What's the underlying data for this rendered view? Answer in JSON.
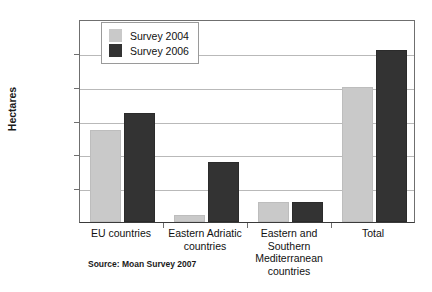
{
  "chart_data": {
    "type": "bar",
    "title": "",
    "xlabel": "",
    "ylabel": "Hectares",
    "ylim": [
      0,
      6000000
    ],
    "ytick_values": [
      0,
      1000000,
      2000000,
      3000000,
      4000000,
      5000000,
      6000000
    ],
    "ytick_labels": [
      "0",
      "1'000'000",
      "2'000'000",
      "3'000'000",
      "4'000'000",
      "5'000'000",
      "6'000'000"
    ],
    "grid": true,
    "legend_position": "upper left",
    "categories": [
      "EU countries",
      "Eastern Adriatic countries",
      "Eastern and Southern Mediterranean countries",
      "Total"
    ],
    "category_label_lines": [
      [
        "EU countries"
      ],
      [
        "Eastern Adriatic",
        "countries"
      ],
      [
        "Eastern and",
        "Southern",
        "Mediterranean",
        "countries"
      ],
      [
        "Total"
      ]
    ],
    "series": [
      {
        "name": "Survey 2004",
        "color": "#c9c9c9",
        "values": [
          2720000,
          210000,
          600000,
          4000000
        ]
      },
      {
        "name": "Survey 2006",
        "color": "#333333",
        "values": [
          3220000,
          1760000,
          600000,
          5070000
        ]
      }
    ],
    "source": "Source: Moan Survey 2007"
  },
  "legend": {
    "items": [
      {
        "label": "Survey 2004"
      },
      {
        "label": "Survey 2006"
      }
    ]
  },
  "footer": {
    "source": "Source: Moan Survey 2007"
  }
}
